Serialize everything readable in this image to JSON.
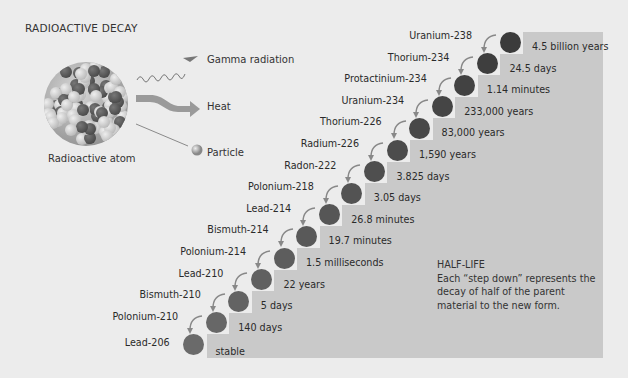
{
  "title": "RADIOACTIVE DECAY",
  "atom": {
    "label": "Radioactive atom"
  },
  "emissions": [
    {
      "label": "Gamma radiation",
      "icon": "wavy-arrow-icon"
    },
    {
      "label": "Heat",
      "icon": "thick-arrow-icon"
    },
    {
      "label": "Particle",
      "icon": "particle-icon"
    }
  ],
  "chain": [
    {
      "nuclide": "Uranium-238",
      "half_life": "4.5 billion years"
    },
    {
      "nuclide": "Thorium-234",
      "half_life": "24.5 days"
    },
    {
      "nuclide": "Protactinium-234",
      "half_life": "1.14 minutes"
    },
    {
      "nuclide": "Uranium-234",
      "half_life": "233,000 years"
    },
    {
      "nuclide": "Thorium-226",
      "half_life": "83,000 years"
    },
    {
      "nuclide": "Radium-226",
      "half_life": "1,590 years"
    },
    {
      "nuclide": "Radon-222",
      "half_life": "3.825 days"
    },
    {
      "nuclide": "Polonium-218",
      "half_life": "3.05 days"
    },
    {
      "nuclide": "Lead-214",
      "half_life": "26.8 minutes"
    },
    {
      "nuclide": "Bismuth-214",
      "half_life": "19.7 minutes"
    },
    {
      "nuclide": "Polonium-214",
      "half_life": "1.5 milliseconds"
    },
    {
      "nuclide": "Lead-210",
      "half_life": "22 years"
    },
    {
      "nuclide": "Bismuth-210",
      "half_life": "5 days"
    },
    {
      "nuclide": "Polonium-210",
      "half_life": "140 days"
    },
    {
      "nuclide": "Lead-206",
      "half_life": "stable"
    }
  ],
  "half_life_note": {
    "heading": "HALF-LIFE",
    "text": "Each “step down” represents the decay of half of the parent material to the new form."
  },
  "colors": {
    "background": "#ececec",
    "step": "#c9c9c9",
    "nucleus_dark": "#3b3b3b",
    "nucleus_light": "#6a6a6a",
    "arrow": "#888888"
  }
}
